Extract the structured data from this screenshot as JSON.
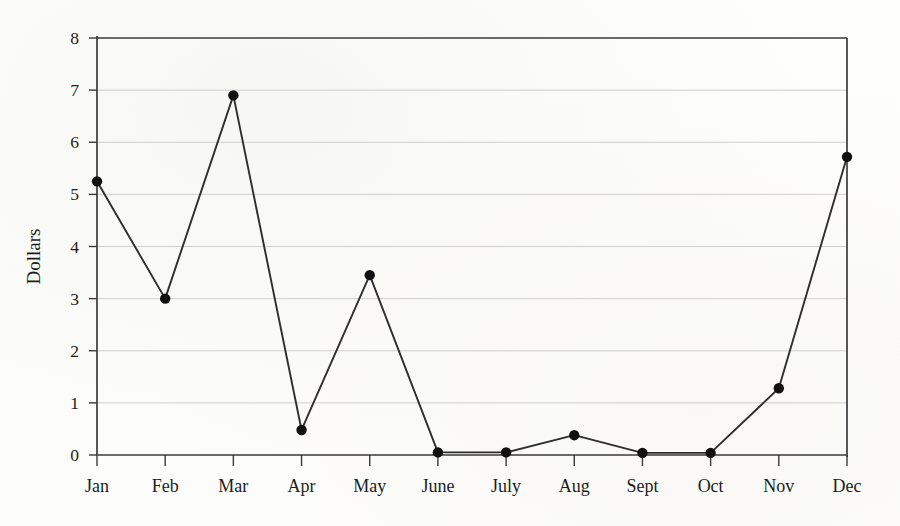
{
  "chart_data": {
    "type": "line",
    "title": "",
    "xlabel": "",
    "ylabel": "Dollars",
    "categories": [
      "Jan",
      "Feb",
      "Mar",
      "Apr",
      "May",
      "June",
      "July",
      "Aug",
      "Sept",
      "Oct",
      "Nov",
      "Dec"
    ],
    "values": [
      5.25,
      3.0,
      6.9,
      0.48,
      3.45,
      0.05,
      0.05,
      0.38,
      0.04,
      0.04,
      1.28,
      5.72
    ],
    "series": [
      {
        "name": "Dollars",
        "values": [
          5.25,
          3.0,
          6.9,
          0.48,
          3.45,
          0.05,
          0.05,
          0.38,
          0.04,
          0.04,
          1.28,
          5.72
        ]
      }
    ],
    "ylim": [
      0,
      8
    ],
    "y_ticks": [
      0,
      1,
      2,
      3,
      4,
      5,
      6,
      7,
      8
    ],
    "y_tick_labels": [
      "0",
      "1",
      "2",
      "3",
      "4",
      "5",
      "6",
      "7",
      "8"
    ],
    "grid": true,
    "grid_axis": "y",
    "legend": false,
    "legend_position": "none",
    "markers": true,
    "marker_shape": "circle",
    "line_color": "#2e2e2e",
    "marker_color": "#111111",
    "grid_color": "#c9c9c9",
    "axis_color": "#3a3a3a",
    "background_color": "#fdfdfc"
  }
}
